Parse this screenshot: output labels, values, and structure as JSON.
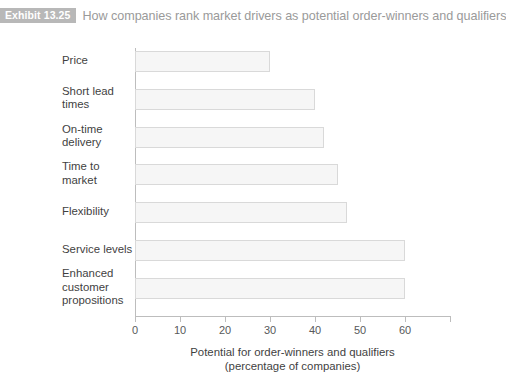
{
  "header": {
    "badge": "Exhibit 13.25",
    "title": "How companies rank market drivers as potential order-winners and qualifiers",
    "badge_color": "#b8b8b8",
    "title_color": "#9a9a9a"
  },
  "chart_data": {
    "type": "bar",
    "orientation": "horizontal",
    "title": "How companies rank market drivers as potential order-winners and qualifiers",
    "categories": [
      "Price",
      "Short lead\ntimes",
      "On-time\ndelivery",
      "Time to\nmarket",
      "Flexibility",
      "Service levels",
      "Enhanced\ncustomer\npropositions"
    ],
    "values": [
      30,
      40,
      42,
      45,
      47,
      60,
      60
    ],
    "xlabel": "Potential for order-winners and qualifiers\n(percentage of companies)",
    "xlabel_line1": "Potential for order-winners and qualifiers",
    "xlabel_line2": "(percentage of companies)",
    "ylabel": "",
    "xlim": [
      0,
      70
    ],
    "xticks": [
      0,
      10,
      20,
      30,
      40,
      50,
      60
    ],
    "xtick_labels": [
      "0",
      "10",
      "20",
      "30",
      "40",
      "50",
      "60"
    ],
    "grid": false,
    "legend": false,
    "bar_fill": "#f6f6f6",
    "bar_border": "#d9d9d9",
    "axis_color": "#bdbdbd"
  }
}
